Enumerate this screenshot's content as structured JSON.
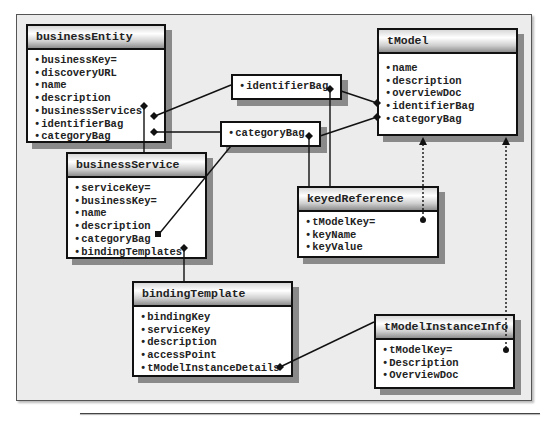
{
  "diagram": {
    "entities": {
      "businessEntity": {
        "title": "businessEntity",
        "fields": [
          "businessKey=",
          "discoveryURL",
          "name",
          "description",
          "businessServices",
          "identifierBag",
          "categoryBag"
        ]
      },
      "businessService": {
        "title": "businessService",
        "fields": [
          "serviceKey=",
          "businessKey=",
          "name",
          "description",
          "categoryBag",
          "bindingTemplates"
        ]
      },
      "bindingTemplate": {
        "title": "bindingTemplate",
        "fields": [
          "bindingKey",
          "serviceKey",
          "description",
          "accessPoint",
          "tModelInstanceDetails"
        ]
      },
      "tModel": {
        "title": "tModel",
        "fields": [
          "name",
          "description",
          "overviewDoc",
          "identifierBag",
          "categoryBag"
        ]
      },
      "keyedReference": {
        "title": "keyedReference",
        "fields": [
          "tModelKey=",
          "keyName",
          "keyValue"
        ]
      },
      "tModelInstanceInfo": {
        "title": "tModelInstanceInfo",
        "fields": [
          "tModelKey=",
          "Description",
          "OverviewDoc"
        ]
      }
    },
    "bags": {
      "identifierBag": "identifierBag",
      "categoryBag": "categoryBag"
    },
    "relationships": [
      {
        "from": "businessEntity.businessServices",
        "to": "businessService",
        "type": "composition"
      },
      {
        "from": "businessEntity.identifierBag",
        "to": "identifierBag",
        "type": "composition"
      },
      {
        "from": "businessEntity.categoryBag",
        "to": "categoryBag",
        "type": "composition"
      },
      {
        "from": "tModel.identifierBag",
        "to": "identifierBag",
        "type": "composition"
      },
      {
        "from": "tModel.categoryBag",
        "to": "categoryBag",
        "type": "composition"
      },
      {
        "from": "identifierBag",
        "to": "keyedReference",
        "type": "composition"
      },
      {
        "from": "categoryBag",
        "to": "keyedReference",
        "type": "composition"
      },
      {
        "from": "businessService.categoryBag",
        "to": "categoryBag",
        "type": "reference"
      },
      {
        "from": "businessService.bindingTemplates",
        "to": "bindingTemplate",
        "type": "composition"
      },
      {
        "from": "bindingTemplate.tModelInstanceDetails",
        "to": "tModelInstanceInfo",
        "type": "composition"
      },
      {
        "from": "keyedReference.tModelKey",
        "to": "tModel",
        "type": "dotted-key-reference"
      },
      {
        "from": "tModelInstanceInfo.tModelKey",
        "to": "tModel",
        "type": "dotted-key-reference"
      }
    ],
    "colors": {
      "background": "#ececec",
      "border": "#111111",
      "shadow": "#8a8a8a",
      "box": "#ffffff"
    }
  }
}
